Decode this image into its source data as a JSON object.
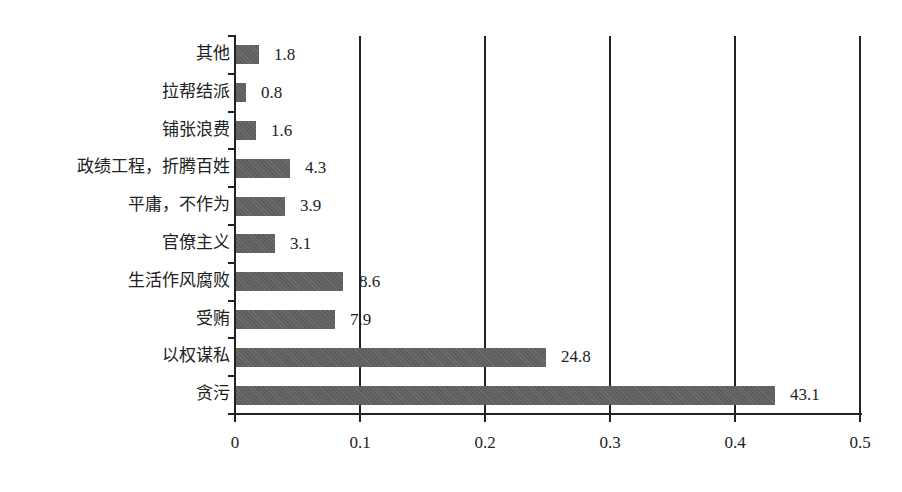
{
  "chart_data": {
    "type": "bar",
    "orientation": "horizontal",
    "title": "",
    "xlabel": "",
    "ylabel": "",
    "xlim": [
      0,
      0.5
    ],
    "x_ticks": [
      "0",
      "0.1",
      "0.2",
      "0.3",
      "0.4",
      "0.5"
    ],
    "grid": "vertical lines at each x tick",
    "legend": "none",
    "categories": [
      "其他",
      "拉帮结派",
      "铺张浪费",
      "政绩工程，折腾百姓",
      "平庸，不作为",
      "官僚主义",
      "生活作风腐败",
      "受贿",
      "以权谋私",
      "贪污"
    ],
    "values": [
      0.018,
      0.008,
      0.016,
      0.043,
      0.039,
      0.031,
      0.086,
      0.079,
      0.248,
      0.431
    ],
    "value_labels": [
      "1.8",
      "0.8",
      "1.6",
      "4.3",
      "3.9",
      "3.1",
      "8.6",
      "7.9",
      "24.8",
      "43.1"
    ],
    "value_label_unit_note": "labels shown as percentages; bar lengths on 0–0.5 proportion axis",
    "bar_color": "#5e5e5e"
  }
}
